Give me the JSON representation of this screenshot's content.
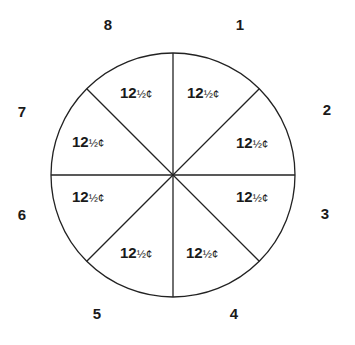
{
  "diagram": {
    "type": "pie-divided-circle",
    "center": [
      173,
      175
    ],
    "radius": 122,
    "stroke_color": "#222222",
    "sections": [
      {
        "number": "1",
        "whole": "12",
        "fraction": "½",
        "unit": "¢",
        "num_pos": [
          240,
          30
        ],
        "val_pos": [
          187,
          98
        ]
      },
      {
        "number": "2",
        "whole": "12",
        "fraction": "½",
        "unit": "¢",
        "num_pos": [
          327,
          115
        ],
        "val_pos": [
          236,
          148
        ]
      },
      {
        "number": "3",
        "whole": "12",
        "fraction": "½",
        "unit": "¢",
        "num_pos": [
          325,
          219
        ],
        "val_pos": [
          236,
          202
        ]
      },
      {
        "number": "4",
        "whole": "12",
        "fraction": "½",
        "unit": "¢",
        "num_pos": [
          234,
          319
        ],
        "val_pos": [
          186,
          258
        ]
      },
      {
        "number": "5",
        "whole": "12",
        "fraction": "½",
        "unit": "¢",
        "num_pos": [
          97,
          319
        ],
        "val_pos": [
          120,
          258
        ]
      },
      {
        "number": "6",
        "whole": "12",
        "fraction": "½",
        "unit": "¢",
        "num_pos": [
          22,
          220
        ],
        "val_pos": [
          72,
          202
        ]
      },
      {
        "number": "7",
        "whole": "12",
        "fraction": "½",
        "unit": "¢",
        "num_pos": [
          22,
          117
        ],
        "val_pos": [
          72,
          147
        ]
      },
      {
        "number": "8",
        "whole": "12",
        "fraction": "½",
        "unit": "¢",
        "num_pos": [
          108,
          30
        ],
        "val_pos": [
          120,
          98
        ]
      }
    ]
  }
}
